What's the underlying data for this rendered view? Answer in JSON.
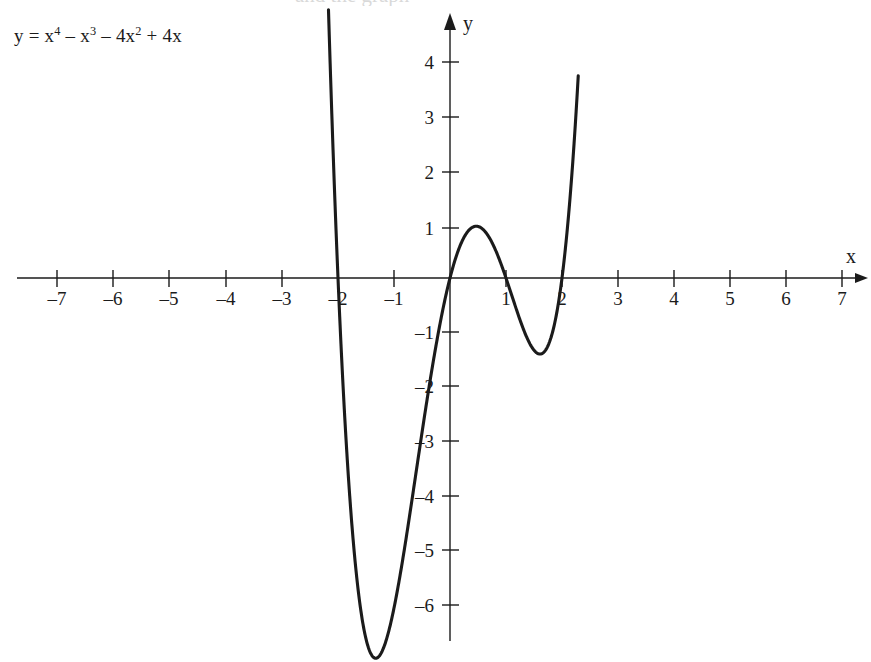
{
  "figure": {
    "equation_text": "y = x4 – x3 – 4x2 + 4x",
    "equation_parts": {
      "lhs": "y = x",
      "exp1": "4",
      "term2": " – x",
      "exp2": "3",
      "term3": " – 4x",
      "exp3": "2",
      "term4": " + 4x"
    },
    "partial_top_text": "and the graph"
  },
  "chart_data": {
    "type": "line",
    "xlabel": "x",
    "ylabel": "y",
    "xlim": [
      -7.75,
      7.6
    ],
    "ylim": [
      -7.1,
      4.8
    ],
    "grid": false,
    "legend": "none",
    "axis_arrows": [
      "x-positive",
      "y-positive"
    ],
    "x_ticks": [
      -7,
      -6,
      -5,
      -4,
      -3,
      -2,
      -1,
      1,
      2,
      3,
      4,
      5,
      6,
      7
    ],
    "x_tick_labels": [
      "–7",
      "–6",
      "–5",
      "–4",
      "–3",
      "–2",
      "–1",
      "1",
      "2",
      "3",
      "4",
      "5",
      "6",
      "7"
    ],
    "y_ticks": [
      4,
      3,
      2,
      1,
      -1,
      -2,
      -3,
      -4,
      -5,
      -6
    ],
    "y_tick_labels": [
      "4",
      "3",
      "2",
      "1",
      "–1",
      "–2",
      "–3",
      "–4",
      "–5",
      "–6"
    ],
    "function": "x^4 - x^3 - 4*x^2 + 4*x",
    "roots": [
      -2,
      0,
      1,
      2
    ],
    "local_extrema": [
      {
        "kind": "minimum",
        "x": -1.33,
        "y": -6.75
      },
      {
        "kind": "maximum",
        "x": 0.45,
        "y": 0.95
      },
      {
        "kind": "minimum",
        "x": 1.62,
        "y": -1.39
      }
    ],
    "x_plot_range": [
      -2.17,
      2.29
    ],
    "series": [
      {
        "name": "y = x^4 - x^3 - 4x^2 + 4x",
        "color": "#1b1b1b",
        "x": [
          -2.17,
          -2.1,
          -2.0,
          -1.9,
          -1.8,
          -1.7,
          -1.6,
          -1.5,
          -1.4,
          -1.33,
          -1.2,
          -1.1,
          -1.0,
          -0.9,
          -0.8,
          -0.7,
          -0.6,
          -0.5,
          -0.4,
          -0.3,
          -0.2,
          -0.1,
          0.0,
          0.1,
          0.2,
          0.3,
          0.4,
          0.45,
          0.5,
          0.6,
          0.7,
          0.8,
          0.9,
          1.0,
          1.1,
          1.2,
          1.3,
          1.4,
          1.5,
          1.62,
          1.7,
          1.8,
          1.9,
          2.0,
          2.05,
          2.1,
          2.15,
          2.2,
          2.25,
          2.29
        ],
        "y": [
          4.33,
          2.5,
          0.0,
          -2.04,
          -3.7,
          -5.02,
          -6.02,
          -6.7,
          -7.06,
          -7.1,
          -6.8,
          -6.34,
          -5.67,
          -4.81,
          -3.81,
          -2.73,
          -1.63,
          -0.56,
          0.41,
          1.22,
          1.81,
          2.13,
          0.0,
          0.36,
          0.64,
          0.82,
          0.91,
          0.92,
          0.87,
          0.73,
          0.52,
          0.25,
          -0.07,
          -0.42,
          -0.78,
          -1.12,
          -1.43,
          -1.68,
          -1.84,
          -1.87,
          -1.8,
          -1.53,
          -1.0,
          0.0,
          0.63,
          1.4,
          2.31,
          3.4,
          4.67,
          5.86
        ]
      }
    ]
  },
  "annotations": {
    "x_axis_label": "x",
    "y_axis_label": "y"
  }
}
